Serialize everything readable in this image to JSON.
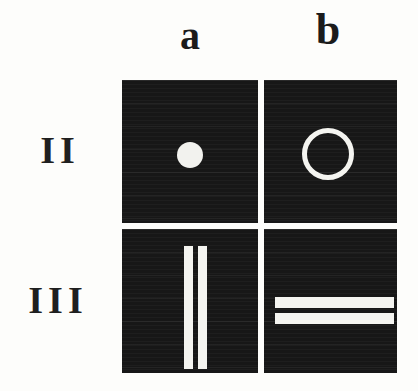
{
  "figure": {
    "name": "panel-grid-figure",
    "background_color": "#fdfdfb",
    "panel_background_color": "#171717",
    "shape_color": "#f4f4f0",
    "label_color": "#1b1b1b",
    "columns": [
      {
        "id": "a",
        "label": "a"
      },
      {
        "id": "b",
        "label": "b"
      }
    ],
    "rows": [
      {
        "id": "II",
        "label": "II"
      },
      {
        "id": "III",
        "label": "III"
      }
    ],
    "panels": [
      {
        "id": "IIa",
        "row": "II",
        "column": "a",
        "shape": "filled-circle",
        "shape_count": 1,
        "description": "single small white filled disc, centered slightly left of panel center"
      },
      {
        "id": "IIb",
        "row": "II",
        "column": "b",
        "shape": "ring",
        "shape_count": 1,
        "description": "single white open circle outline, centered"
      },
      {
        "id": "IIIa",
        "row": "III",
        "column": "a",
        "shape": "vertical-bars",
        "shape_count": 2,
        "description": "two tall white vertical bars near panel center"
      },
      {
        "id": "IIIb",
        "row": "III",
        "column": "b",
        "shape": "horizontal-bars",
        "shape_count": 2,
        "description": "two wide white horizontal bars near panel center"
      }
    ]
  }
}
